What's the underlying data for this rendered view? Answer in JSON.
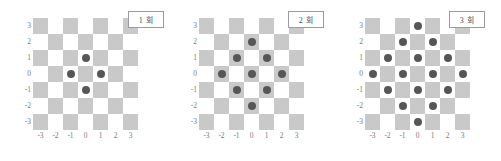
{
  "chart_data": {
    "type": "scatter",
    "title": "",
    "xlabel": "",
    "ylabel": "",
    "xlim": [
      -3.5,
      3.5
    ],
    "ylim": [
      -3.5,
      3.5
    ],
    "grid": true,
    "grid_style": "checkerboard",
    "legend": "none",
    "xticks": [
      "-3",
      "-2",
      "-1",
      "0",
      "1",
      "2",
      "3"
    ],
    "yticks": [
      "3",
      "2",
      "1",
      "0",
      "-1",
      "-2",
      "-3"
    ],
    "panels": [
      {
        "label": "1 회",
        "dot_count": 4,
        "points": [
          {
            "x": 0,
            "y": 1
          },
          {
            "x": -1,
            "y": 0
          },
          {
            "x": 1,
            "y": 0
          },
          {
            "x": 0,
            "y": -1
          }
        ]
      },
      {
        "label": "2 회",
        "dot_count": 9,
        "points": [
          {
            "x": 0,
            "y": 2
          },
          {
            "x": -1,
            "y": 1
          },
          {
            "x": 1,
            "y": 1
          },
          {
            "x": -2,
            "y": 0
          },
          {
            "x": 0,
            "y": 0
          },
          {
            "x": 2,
            "y": 0
          },
          {
            "x": -1,
            "y": -1
          },
          {
            "x": 1,
            "y": -1
          },
          {
            "x": 0,
            "y": -2
          }
        ]
      },
      {
        "label": "3 회",
        "dot_count": 16,
        "points": [
          {
            "x": 0,
            "y": 3
          },
          {
            "x": -1,
            "y": 2
          },
          {
            "x": 1,
            "y": 2
          },
          {
            "x": -2,
            "y": 1
          },
          {
            "x": 0,
            "y": 1
          },
          {
            "x": 2,
            "y": 1
          },
          {
            "x": -3,
            "y": 0
          },
          {
            "x": -1,
            "y": 0
          },
          {
            "x": 1,
            "y": 0
          },
          {
            "x": 3,
            "y": 0
          },
          {
            "x": -2,
            "y": -1
          },
          {
            "x": 0,
            "y": -1
          },
          {
            "x": 2,
            "y": -1
          },
          {
            "x": -1,
            "y": -2
          },
          {
            "x": 1,
            "y": -2
          },
          {
            "x": 0,
            "y": -3
          }
        ]
      }
    ],
    "colors": {
      "dot": "#565656",
      "cell_dark": "#c9c9c9",
      "cell_light": "#ffffff",
      "tick_label": "#7a7a7a",
      "box_border": "#9a9aa8",
      "background": "#ffffff"
    }
  }
}
